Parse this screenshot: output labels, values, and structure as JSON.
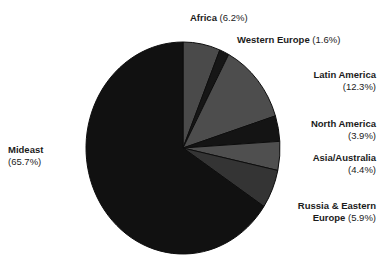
{
  "chart_data": {
    "type": "pie",
    "title": "",
    "subtitle": "",
    "xlabel": "",
    "ylabel": "",
    "legend_position": "none",
    "grid": false,
    "labels_show_percent": true,
    "start_angle_deg": 0,
    "direction": "clockwise",
    "categories": [
      "Africa",
      "Western Europe",
      "Latin America",
      "North America",
      "Asia/Australia",
      "Russia & Eastern Europe",
      "Mideast"
    ],
    "values": [
      6.2,
      1.6,
      12.3,
      3.9,
      4.4,
      5.9,
      65.7
    ],
    "units": "percent",
    "total": 100.0,
    "slices": [
      {
        "name": "Africa",
        "value": 6.2,
        "percent_text": "(6.2%)",
        "color": "#4a4a4a"
      },
      {
        "name": "Western Europe",
        "value": 1.6,
        "percent_text": "(1.6%)",
        "color": "#161616"
      },
      {
        "name": "Latin America",
        "value": 12.3,
        "percent_text": "(12.3%)",
        "color": "#4d4d4d"
      },
      {
        "name": "North America",
        "value": 3.9,
        "percent_text": "(3.9%)",
        "color": "#141414"
      },
      {
        "name": "Asia/Australia",
        "value": 4.4,
        "percent_text": "(4.4%)",
        "color": "#4f4f4f"
      },
      {
        "name": "Russia & Eastern Europe",
        "value": 5.9,
        "percent_text": "(5.9%)",
        "color": "#343434"
      },
      {
        "name": "Mideast",
        "value": 65.7,
        "percent_text": "(65.7%)",
        "color": "#111111"
      }
    ]
  },
  "labels": {
    "africa": {
      "name": "Africa",
      "percent": "(6.2%)"
    },
    "western_europe": {
      "name": "Western Europe",
      "percent": "(1.6%)"
    },
    "latin_america": {
      "name": "Latin America",
      "percent": "(12.3%)"
    },
    "north_america": {
      "name": "North America",
      "percent": "(3.9%)"
    },
    "asia_australia": {
      "name": "Asia/Australia",
      "percent": "(4.4%)"
    },
    "russia_eastern_europe": {
      "name_line1": "Russia & Eastern",
      "name_line2": "Europe",
      "percent": "(5.9%)"
    },
    "mideast": {
      "name": "Mideast",
      "percent": "(65.7%)"
    }
  },
  "colors": {
    "background": "#ffffff",
    "text": "#1b1b1b",
    "slice_light": "#4d4d4d",
    "slice_mid": "#343434",
    "slice_dark": "#121212"
  },
  "geometry": {
    "center_x": 183,
    "center_y": 148,
    "radius_x": 97,
    "radius_y": 106
  }
}
